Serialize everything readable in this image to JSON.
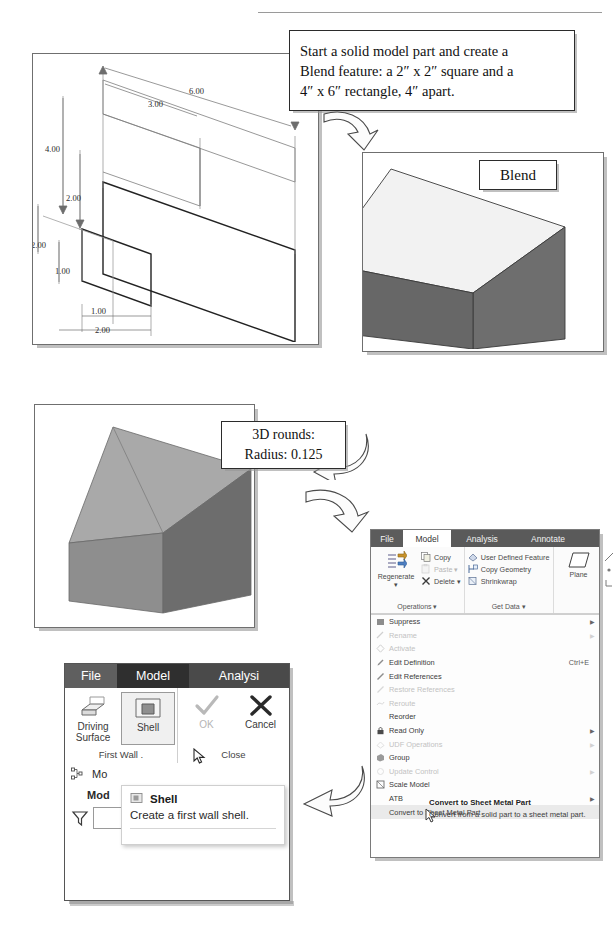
{
  "callouts": {
    "instruction": {
      "name": "instruction-callout",
      "lines": [
        "Start a solid model part and create a",
        "Blend feature: a 2″ x 2″ square and a",
        "4″ x 6″ rectangle, 4″ apart."
      ]
    },
    "blend": {
      "label": "Blend"
    },
    "rounds": {
      "lines": [
        "3D rounds:",
        "Radius: 0.125"
      ]
    }
  },
  "sketch": {
    "title": "isometric-dimensioned-sketch",
    "dimensions": [
      {
        "value": "6.00",
        "x": 152,
        "y": 38
      },
      {
        "value": "3.00",
        "x": 117,
        "y": 51
      },
      {
        "value": "4.00",
        "x": 48,
        "y": 96
      },
      {
        "value": "2.00",
        "x": 70,
        "y": 143
      },
      {
        "value": "2.00",
        "x": 21,
        "y": 193
      },
      {
        "value": "1.00",
        "x": 43,
        "y": 217
      },
      {
        "value": "1.00",
        "x": 72,
        "y": 258
      },
      {
        "value": "2.00",
        "x": 89,
        "y": 277
      }
    ]
  },
  "ribbon": {
    "tabs": [
      {
        "label": "File",
        "state": "file"
      },
      {
        "label": "Model",
        "state": "active"
      },
      {
        "label": "Analysis",
        "state": "normal"
      },
      {
        "label": "Annotate",
        "state": "normal"
      }
    ],
    "groups": [
      {
        "title": "Operations ▾",
        "big": {
          "label": "Regenerate\n▾",
          "icon": "regenerate-icon"
        },
        "items": [
          {
            "label": "Copy",
            "icon": "copy-icon",
            "enabled": true
          },
          {
            "label": "Paste  ▾",
            "icon": "paste-icon",
            "enabled": false
          },
          {
            "label": "Delete  ▾",
            "icon": "delete-icon",
            "enabled": true
          }
        ]
      },
      {
        "title": "Get Data ▾",
        "items": [
          {
            "label": "User Defined Feature",
            "icon": "udf-icon",
            "enabled": true
          },
          {
            "label": "Copy Geometry",
            "icon": "copy-geometry-icon",
            "enabled": true
          },
          {
            "label": "Shrinkwrap",
            "icon": "shrinkwrap-icon",
            "enabled": true
          }
        ]
      },
      {
        "title": "",
        "big": {
          "label": "Plane",
          "icon": "plane-icon"
        },
        "items": []
      }
    ]
  },
  "context_menu": {
    "items": [
      {
        "label": "Suppress",
        "icon": "suppress-icon",
        "enabled": true,
        "submenu": true,
        "accel": ""
      },
      {
        "label": "Rename",
        "icon": "rename-icon",
        "enabled": false,
        "submenu": true,
        "accel": ""
      },
      {
        "label": "Activate",
        "icon": "activate-icon",
        "enabled": false,
        "submenu": false,
        "accel": ""
      },
      {
        "label": "Edit Definition",
        "icon": "edit-definition-icon",
        "enabled": true,
        "submenu": false,
        "accel": "Ctrl+E"
      },
      {
        "label": "Edit References",
        "icon": "edit-references-icon",
        "enabled": true,
        "submenu": false,
        "accel": ""
      },
      {
        "label": "Restore References",
        "icon": "restore-references-icon",
        "enabled": false,
        "submenu": false,
        "accel": ""
      },
      {
        "label": "Reroute",
        "icon": "reroute-icon",
        "enabled": false,
        "submenu": false,
        "accel": ""
      },
      {
        "label": "Reorder",
        "icon": "reorder-icon",
        "enabled": true,
        "submenu": false,
        "accel": ""
      },
      {
        "label": "Read Only",
        "icon": "read-only-icon",
        "enabled": true,
        "submenu": true,
        "accel": ""
      },
      {
        "label": "UDF Operations",
        "icon": "udf-operations-icon",
        "enabled": false,
        "submenu": true,
        "accel": ""
      },
      {
        "label": "Group",
        "icon": "group-icon",
        "enabled": true,
        "submenu": false,
        "accel": ""
      },
      {
        "label": "Update Control",
        "icon": "update-control-icon",
        "enabled": false,
        "submenu": true,
        "accel": ""
      },
      {
        "label": "Scale Model",
        "icon": "scale-model-icon",
        "enabled": true,
        "submenu": false,
        "accel": ""
      },
      {
        "label": "ATB",
        "icon": "atb-icon",
        "enabled": true,
        "submenu": true,
        "accel": ""
      },
      {
        "label": "Convert to Sheet Metal Part",
        "icon": "convert-sheetmetal-icon",
        "enabled": true,
        "submenu": false,
        "accel": ""
      }
    ],
    "tooltip": {
      "title": "Convert to Sheet Metal Part",
      "body": "Convert from a solid part to a sheet metal part."
    }
  },
  "shell_dialog": {
    "tabs": [
      {
        "label": "File",
        "state": "file"
      },
      {
        "label": "Model",
        "state": "active"
      },
      {
        "label": "Analysi",
        "state": "normal"
      }
    ],
    "groups": [
      {
        "title": "First Wall  .",
        "buttons": [
          {
            "label": "Driving\nSurface",
            "icon": "driving-surface-icon",
            "selected": false,
            "enabled": true
          },
          {
            "label": "Shell",
            "icon": "shell-icon",
            "selected": true,
            "enabled": true
          }
        ]
      },
      {
        "title": "Close",
        "buttons": [
          {
            "label": "OK",
            "icon": "check-icon",
            "selected": false,
            "enabled": false
          },
          {
            "label": "Cancel",
            "icon": "x-icon",
            "selected": false,
            "enabled": true
          }
        ]
      }
    ],
    "tree_row": "Mo",
    "tree_row2": "Mod",
    "filter_placeholder": "",
    "tooltip": {
      "title": "Shell",
      "body": "Create a first wall shell."
    }
  },
  "arrows": [
    {
      "name": "arrow-sketch-to-blend",
      "dir": "down-right"
    },
    {
      "name": "arrow-blend-to-rounds",
      "dir": "down-left"
    },
    {
      "name": "arrow-rounds-to-menu",
      "dir": "down-right"
    },
    {
      "name": "arrow-menu-to-shell",
      "dir": "down-left"
    }
  ]
}
